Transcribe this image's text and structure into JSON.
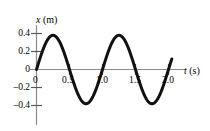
{
  "figure": {
    "background_color": "#ffffff",
    "curve_color": "#111111",
    "axis_color": "#808080",
    "text_color": "#000000"
  },
  "axes": {
    "y_title_symbol": "x",
    "y_title_unit": "(m)",
    "x_title_symbol": "t",
    "x_title_unit": "(s)"
  },
  "ticks": {
    "y": [
      "0.4",
      "0.2",
      "0",
      "–0.2",
      "–0.4"
    ],
    "x": [
      "0",
      "0.5",
      "1.0",
      "1.5",
      "2.0"
    ]
  },
  "chart_data": {
    "type": "line",
    "title": "",
    "subtitle": "",
    "xlabel": "t (s)",
    "ylabel": "x (m)",
    "xlim": [
      0,
      2.08
    ],
    "ylim": [
      -0.48,
      0.46
    ],
    "xticks": [
      0,
      0.5,
      1.0,
      1.5,
      2.0
    ],
    "xticklabels": [
      "0",
      "0.5",
      "1.0",
      "1.5",
      "2.0"
    ],
    "yticks": [
      -0.4,
      -0.2,
      0,
      0.2,
      0.4
    ],
    "yticklabels": [
      "–0.4",
      "–0.2",
      "0",
      "0.2",
      "0.4"
    ],
    "grid": false,
    "legend": null,
    "annotations": [],
    "series": [
      {
        "name": "x(t)",
        "form": "sine",
        "amplitude": 0.38,
        "period": 1.0,
        "phase": 0,
        "equation": "x(t) = 0.38 sin(2πt / 1.0)",
        "x": [
          0.0,
          0.05,
          0.1,
          0.15,
          0.2,
          0.25,
          0.3,
          0.35,
          0.4,
          0.45,
          0.5,
          0.55,
          0.6,
          0.65,
          0.7,
          0.75,
          0.8,
          0.85,
          0.9,
          0.95,
          1.0,
          1.05,
          1.1,
          1.15,
          1.2,
          1.25,
          1.3,
          1.35,
          1.4,
          1.45,
          1.5,
          1.55,
          1.6,
          1.65,
          1.7,
          1.75,
          1.8,
          1.85,
          1.9,
          1.95,
          2.0,
          2.05
        ],
        "y": [
          0.0,
          0.117,
          0.223,
          0.307,
          0.361,
          0.38,
          0.361,
          0.307,
          0.223,
          0.117,
          0.0,
          -0.117,
          -0.223,
          -0.307,
          -0.361,
          -0.38,
          -0.361,
          -0.307,
          -0.223,
          -0.117,
          0.0,
          0.117,
          0.223,
          0.307,
          0.361,
          0.38,
          0.361,
          0.307,
          0.223,
          0.117,
          0.0,
          -0.117,
          -0.223,
          -0.307,
          -0.361,
          -0.38,
          -0.361,
          -0.307,
          -0.223,
          -0.117,
          0.0,
          0.117
        ]
      }
    ],
    "maxima": [
      {
        "t": 0.25,
        "x": 0.38
      },
      {
        "t": 1.25,
        "x": 0.38
      }
    ],
    "minima": [
      {
        "t": 0.75,
        "x": -0.38
      },
      {
        "t": 1.75,
        "x": -0.38
      }
    ],
    "zero_crossings": [
      0.0,
      0.5,
      1.0,
      1.5,
      2.0
    ]
  }
}
